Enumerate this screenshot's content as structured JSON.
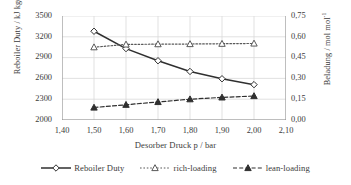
{
  "chart_data": {
    "type": "line",
    "title": "",
    "xlabel": "Desorber Druck p / bar",
    "ylabel": "Reboiler Duty / kJ kg(CO₂)⁻¹",
    "y2label": "Beladung / mol mol⁻¹",
    "x": [
      1.5,
      1.6,
      1.7,
      1.8,
      1.9,
      2.0
    ],
    "xlim": [
      1.4,
      2.1
    ],
    "ylim": [
      2000,
      3500
    ],
    "y2lim": [
      0.0,
      0.75
    ],
    "grid": true,
    "legend_position": "bottom",
    "xticks": [
      "1,40",
      "1,50",
      "1,60",
      "1,70",
      "1,80",
      "1,90",
      "2,00",
      "2,10"
    ],
    "xtick_values": [
      1.4,
      1.5,
      1.6,
      1.7,
      1.8,
      1.9,
      2.0,
      2.1
    ],
    "yticks": [
      "2000",
      "2300",
      "2600",
      "2900",
      "3200",
      "3500"
    ],
    "ytick_values": [
      2000,
      2300,
      2600,
      2900,
      3200,
      3500
    ],
    "y2ticks": [
      "0,00",
      "0,15",
      "0,30",
      "0,45",
      "0,60",
      "0,75"
    ],
    "y2tick_values": [
      0.0,
      0.15,
      0.3,
      0.45,
      0.6,
      0.75
    ],
    "series": [
      {
        "name": "Reboiler Duty",
        "axis": "left",
        "marker": "open-diamond",
        "line": "solid",
        "color": "#2f2f2f",
        "values": [
          3280,
          3030,
          2855,
          2700,
          2595,
          2510
        ]
      },
      {
        "name": "rich-loading",
        "axis": "right",
        "marker": "open-triangle",
        "line": "dotted",
        "color": "#595959",
        "values": [
          0.525,
          0.545,
          0.547,
          0.548,
          0.55,
          0.552
        ]
      },
      {
        "name": "lean-loading",
        "axis": "right",
        "marker": "filled-triangle",
        "line": "dashed",
        "color": "#2f2f2f",
        "values": [
          0.09,
          0.11,
          0.13,
          0.15,
          0.163,
          0.173
        ]
      }
    ]
  },
  "axes": {
    "ylabel_prefix": "Reboiler Duty / kJ kg(CO",
    "ylabel_sub": "2",
    "ylabel_suffix": ")",
    "ylabel_sup": "-1",
    "y2label_prefix": "Beladung / mol mol",
    "y2label_sup": "-1",
    "xlabel": "Desorber Druck p / bar"
  },
  "legend": {
    "items": [
      {
        "label": "Reboiler Duty"
      },
      {
        "label": "rich-loading"
      },
      {
        "label": "lean-loading"
      }
    ]
  },
  "colors": {
    "axis": "#8c8c8c",
    "grid": "#d9d9d9",
    "text": "#3b3b3b",
    "series_primary": "#2f2f2f",
    "series_secondary": "#595959",
    "background": "#ffffff"
  }
}
